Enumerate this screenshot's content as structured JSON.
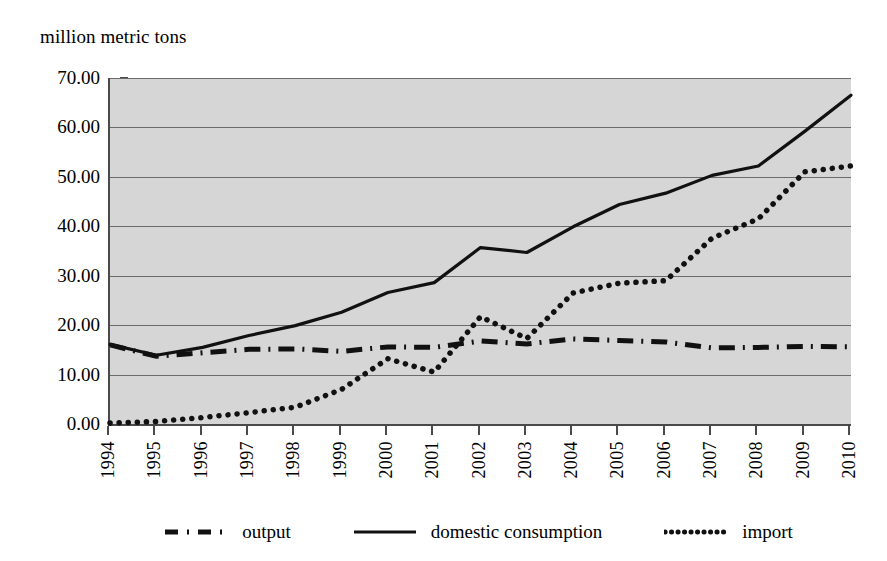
{
  "chart_data": {
    "type": "line",
    "title": "",
    "ylabel": "million metric tons",
    "xlabel": "",
    "ylim": [
      0,
      70
    ],
    "yticks": [
      "0.00",
      "10.00",
      "20.00",
      "30.00",
      "40.00",
      "50.00",
      "60.00",
      "70.00"
    ],
    "ytick_values": [
      0,
      10,
      20,
      30,
      40,
      50,
      60,
      70
    ],
    "grid": true,
    "legend_position": "bottom",
    "categories": [
      "1994",
      "1995",
      "1996",
      "1997",
      "1998",
      "1999",
      "2000",
      "2001",
      "2002",
      "2003",
      "2004",
      "2005",
      "2006",
      "2007",
      "2008",
      "2009",
      "2010"
    ],
    "x": [
      1994,
      1995,
      1996,
      1997,
      1998,
      1999,
      2000,
      2001,
      2002,
      2003,
      2004,
      2005,
      2006,
      2007,
      2008,
      2009,
      2010
    ],
    "series": [
      {
        "name": "output",
        "style": "dash-dot",
        "color": "#111111",
        "values": [
          16.0,
          13.7,
          14.4,
          15.1,
          15.2,
          14.7,
          15.6,
          15.5,
          16.8,
          16.2,
          17.2,
          16.9,
          16.6,
          15.4,
          15.5,
          15.7,
          15.6
        ]
      },
      {
        "name": "domestic consumption",
        "style": "solid",
        "color": "#111111",
        "values": [
          16.1,
          13.9,
          15.5,
          17.9,
          19.9,
          22.6,
          26.6,
          28.6,
          35.7,
          34.7,
          39.9,
          44.4,
          46.7,
          50.3,
          52.2,
          59.2,
          66.5
        ]
      },
      {
        "name": "import",
        "style": "dotted",
        "color": "#111111",
        "values": [
          0.2,
          0.5,
          1.3,
          2.3,
          3.4,
          7.0,
          13.2,
          10.5,
          21.7,
          17.3,
          26.5,
          28.5,
          29.0,
          37.6,
          41.5,
          51.0,
          52.2
        ]
      }
    ],
    "legend": [
      {
        "label": "output",
        "style": "dash-dot"
      },
      {
        "label": "domestic consumption",
        "style": "solid"
      },
      {
        "label": "import",
        "style": "dotted"
      }
    ],
    "colors": {
      "plot_background": "#d6d6d6",
      "gridline": "#6b6b6b",
      "axis": "#4a4a4a",
      "series": "#111111",
      "page_background": "#ffffff"
    }
  }
}
